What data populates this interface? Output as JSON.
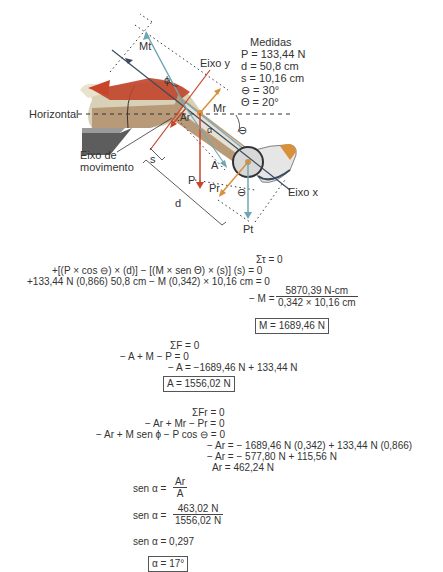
{
  "diagram": {
    "labels": {
      "M_t": "Mt",
      "eixo_y": "Eixo y",
      "phi": "ϕ",
      "M_r": "Mr",
      "A_r": "Ar",
      "alpha": "α",
      "horizontal": "Horizontal",
      "theta_top": "⊖",
      "theta_bottom": "⊖",
      "eixo_de": "Eixo de",
      "movimento": "movimento",
      "s": "s",
      "A": "A",
      "P": "P",
      "P_r": "Pr",
      "P_t": "Pt",
      "eixo_x": "Eixo x",
      "d": "d"
    },
    "medidas": {
      "title": "Medidas",
      "P": "P = 133,44 N",
      "d": "d = 50,8 cm",
      "s": "s = 10,16 cm",
      "theta1": "⊖ = 30°",
      "theta2": "Θ = 20°"
    },
    "colors": {
      "force_red": "#c8452a",
      "force_blue": "#6fa8b4",
      "force_orange": "#d8913a",
      "axis_dark": "#3a4a60",
      "muscle": "#c0442a",
      "leg": "#b89a78"
    }
  },
  "equations": {
    "torque": {
      "l1": "Στ = 0",
      "l2": "+[(P × cos ⊖) × (d)] − [(M × sen Θ) × (s)] (s) = 0",
      "l3": "+133,44 N (0,866) 50,8 cm − M (0,342) × 10,16 cm = 0",
      "l4_prefix": "− M =",
      "l4_num": "5870,39 N-cm",
      "l4_den": "0,342 × 10,16 cm",
      "result": "M = 1689,46 N"
    },
    "force": {
      "l1": "ΣF = 0",
      "l2": "− A + M − P = 0",
      "l3": "− A = −1689,46 N + 133,44 N",
      "result": "A = 1556,02 N"
    },
    "rotary": {
      "l1": "ΣFr = 0",
      "l2": "− Ar + Mr − Pr = 0",
      "l3": "− Ar + M sen ϕ − P cos ⊖ = 0",
      "l4": "− Ar = − 1689,46 N (0,342) + 133,44 N (0,866)",
      "l5": "− Ar = − 577,80 N + 115,56 N",
      "l6": "Ar = 462,24 N"
    },
    "angle": {
      "l1_prefix": "sen α =",
      "l1_num": "Ar",
      "l1_den": "A",
      "l2_prefix": "sen α =",
      "l2_num": "463,02 N",
      "l2_den": "1556,02 N",
      "l3": "sen α = 0,297",
      "result": "α = 17°"
    }
  }
}
